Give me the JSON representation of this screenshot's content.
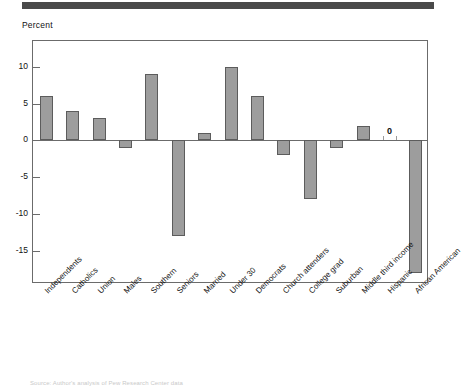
{
  "axis_title": "Percent",
  "zero_label": "0",
  "source_note": "Source: Author's analysis of Pew Research Center data",
  "colors": {
    "bar_fill": "#9d9d9d",
    "bar_stroke": "#5c5c5c",
    "frame": "#6b6b6b",
    "header_bar": "#4a4a4a",
    "text": "#111111"
  },
  "chart_data": {
    "type": "bar",
    "title": "",
    "subtitle": "",
    "xlabel": "",
    "ylabel": "Percent",
    "ylim": [
      -19.5,
      13.5
    ],
    "yticks": [
      10,
      5,
      0,
      -5,
      -10,
      -15
    ],
    "grid": false,
    "legend": "none",
    "orientation": "vertical",
    "categories": [
      "Independents",
      "Catholics",
      "Union",
      "Males",
      "Southern",
      "Seniors",
      "Married",
      "Under 30",
      "Democrats",
      "Church attenders",
      "College grad",
      "Suburban",
      "Middle third income",
      "Hispanic",
      "African American"
    ],
    "values": [
      6,
      4,
      3,
      -1,
      9,
      -13,
      1,
      10,
      6,
      -2,
      -8,
      -1,
      2,
      0,
      -18
    ],
    "annotations": [
      {
        "category": "Hispanic",
        "text": "0",
        "value": 0
      }
    ]
  }
}
